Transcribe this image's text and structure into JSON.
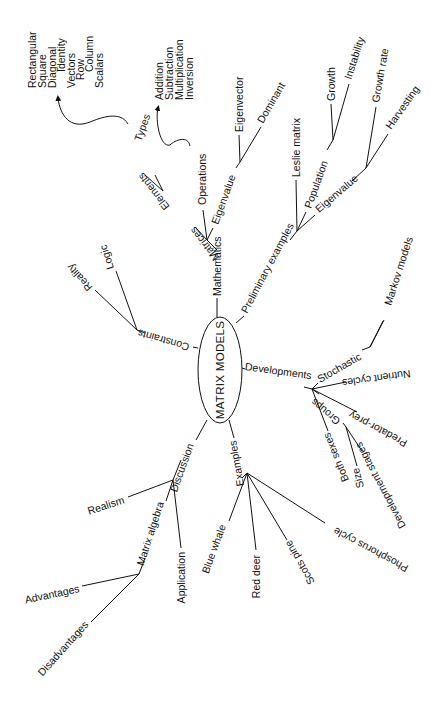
{
  "center": {
    "label": "MATRIX MODELS"
  },
  "branches": {
    "mathematics": {
      "label": "Mathematics",
      "matrices": {
        "label": "Matrices",
        "elements": "Elements",
        "types": "Types",
        "types_list": [
          "Rectangular",
          "Square",
          "Diagonal",
          "Identity",
          "Vectors",
          "Row",
          "Column",
          "Scalars"
        ]
      },
      "operations": {
        "label": "Operations",
        "list": [
          "Addition",
          "Subtraction",
          "Multiplication",
          "Inversion"
        ]
      },
      "eigenvalue": {
        "label": "Eigenvalue",
        "children": [
          "Eigenvector",
          "Dominant"
        ]
      }
    },
    "preliminary": {
      "label": "Preliminary examples",
      "leslie": "Leslie matrix",
      "population": {
        "label": "Population",
        "children": [
          "Growth",
          "Instability"
        ]
      },
      "eigenvalue": {
        "label": "Eigenvalue",
        "children": [
          "Growth rate",
          "Harvesting"
        ]
      }
    },
    "developments": {
      "label": "Developments",
      "stochastic": {
        "label": "Stochastic",
        "child": "Markov models"
      },
      "nutrient": "Nutrient cycles",
      "predator": "Predator-prey",
      "groups": {
        "label": "Groups",
        "children": [
          "Size",
          "Development stages"
        ]
      },
      "both_sexes": "Both sexes"
    },
    "examples": {
      "label": "Examples",
      "children": [
        "Blue whale",
        "Red deer",
        "Scots pine",
        "Phosphorus cycle"
      ]
    },
    "discussion": {
      "label": "Discussion",
      "realism": "Realism",
      "matrix_algebra": {
        "label": "Matrix algebra",
        "children": [
          "Advantages",
          "Disadvantages"
        ]
      },
      "application": "Application"
    },
    "constraints": {
      "label": "Constraints",
      "children": [
        "Reality",
        "Logic"
      ]
    }
  },
  "colors": {
    "ink": "#111111",
    "background": "#ffffff"
  }
}
